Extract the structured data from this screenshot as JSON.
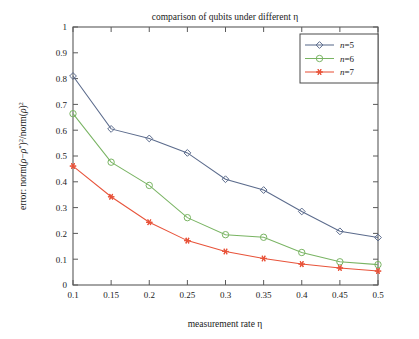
{
  "chart_data": {
    "type": "line",
    "title": "comparison of qubits under different η",
    "xlabel": "measurement rate η",
    "ylabel": "error: norm(ρ−ρ*)²/norm(ρ)²",
    "x": [
      0.1,
      0.15,
      0.2,
      0.25,
      0.3,
      0.35,
      0.4,
      0.45,
      0.5
    ],
    "xlim": [
      0.1,
      0.5
    ],
    "ylim": [
      0,
      1
    ],
    "xticks": [
      "0.1",
      "0.15",
      "0.2",
      "0.25",
      "0.3",
      "0.35",
      "0.4",
      "0.45",
      "0.5"
    ],
    "yticks": [
      "0",
      "0.1",
      "0.2",
      "0.3",
      "0.4",
      "0.5",
      "0.6",
      "0.7",
      "0.8",
      "0.9",
      "1"
    ],
    "grid": false,
    "legend_position": "top-right",
    "series": [
      {
        "name": "n=5",
        "color": "#5b6b8c",
        "marker": "diamond-open",
        "values": [
          0.81,
          0.605,
          0.568,
          0.512,
          0.41,
          0.368,
          0.285,
          0.208,
          0.184
        ]
      },
      {
        "name": "n=6",
        "color": "#79b463",
        "marker": "circle-open",
        "values": [
          0.664,
          0.476,
          0.386,
          0.261,
          0.195,
          0.185,
          0.126,
          0.09,
          0.079
        ]
      },
      {
        "name": "n=7",
        "color": "#e8533a",
        "marker": "star-filled",
        "values": [
          0.461,
          0.342,
          0.243,
          0.172,
          0.13,
          0.103,
          0.081,
          0.066,
          0.054
        ]
      }
    ]
  },
  "figure": {
    "background_color": "#ffffff",
    "axis_color": "#5a5a5a",
    "legend_border_color": "#4a4a4a"
  }
}
